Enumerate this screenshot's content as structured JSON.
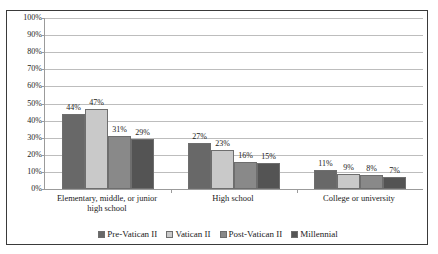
{
  "chart_data": {
    "type": "bar",
    "title": "",
    "xlabel": "",
    "ylabel": "",
    "ylim": [
      0,
      100
    ],
    "grid": true,
    "legend_position": "bottom",
    "value_label_suffix": "%",
    "categories": [
      "Elementary, middle, or junior high school",
      "High school",
      "College or university"
    ],
    "category_lines": [
      [
        "Elementary, middle, or junior",
        "high school"
      ],
      [
        "High school"
      ],
      [
        "College or university"
      ]
    ],
    "series": [
      {
        "name": "Pre-Vatican II",
        "color": "#686868",
        "values": [
          44,
          27,
          11
        ],
        "labels": [
          "44%",
          "27%",
          "11%"
        ]
      },
      {
        "name": "Vatican II",
        "color": "#c9c9c9",
        "values": [
          47,
          23,
          9
        ],
        "labels": [
          "47%",
          "23%",
          "9%"
        ]
      },
      {
        "name": "Post-Vatican II",
        "color": "#898989",
        "values": [
          31,
          16,
          8
        ],
        "labels": [
          "31%",
          "16%",
          "8%"
        ]
      },
      {
        "name": "Millennial",
        "color": "#545454",
        "values": [
          29,
          15,
          7
        ],
        "labels": [
          "29%",
          "15%",
          "7%"
        ]
      }
    ],
    "yticks": [
      {
        "value": 100,
        "label": "100%"
      },
      {
        "value": 90,
        "label": "90%"
      },
      {
        "value": 80,
        "label": "80%"
      },
      {
        "value": 70,
        "label": "70%"
      },
      {
        "value": 60,
        "label": "60%"
      },
      {
        "value": 50,
        "label": "50%"
      },
      {
        "value": 40,
        "label": "40%"
      },
      {
        "value": 30,
        "label": "30%"
      },
      {
        "value": 20,
        "label": "20%"
      },
      {
        "value": 10,
        "label": "10%"
      },
      {
        "value": 0,
        "label": "0%"
      }
    ]
  }
}
